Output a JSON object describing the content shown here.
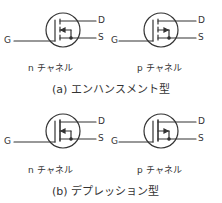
{
  "figure": {
    "sections": [
      {
        "caption": "(a) エンハンスメント型",
        "type": "enhancement",
        "symbols": [
          {
            "channel": "n",
            "label": "n チャネル",
            "terminals": {
              "gate": "G",
              "drain": "D",
              "source": "S"
            }
          },
          {
            "channel": "p",
            "label": "p チャネル",
            "terminals": {
              "gate": "G",
              "drain": "D",
              "source": "S"
            }
          }
        ]
      },
      {
        "caption": "(b) デプレッション型",
        "type": "depletion",
        "symbols": [
          {
            "channel": "n",
            "label": "n チャネル",
            "terminals": {
              "gate": "G",
              "drain": "D",
              "source": "S"
            }
          },
          {
            "channel": "p",
            "label": "p チャネル",
            "terminals": {
              "gate": "G",
              "drain": "D",
              "source": "S"
            }
          }
        ]
      }
    ],
    "colors": {
      "line": "#333333",
      "background": "#ffffff"
    }
  }
}
